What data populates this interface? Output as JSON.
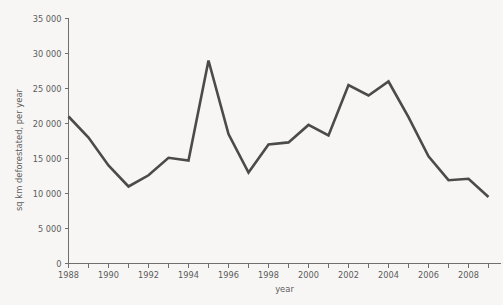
{
  "chart_data": {
    "type": "line",
    "title": "",
    "xlabel": "year",
    "ylabel": "sq km deforestated, per year",
    "x": [
      1988,
      1989,
      1990,
      1991,
      1992,
      1993,
      1994,
      1995,
      1996,
      1997,
      1998,
      1999,
      2000,
      2001,
      2002,
      2003,
      2004,
      2005,
      2006,
      2007,
      2008,
      2009
    ],
    "values": [
      21000,
      18000,
      14000,
      11000,
      12600,
      15100,
      14700,
      29000,
      18500,
      13000,
      17000,
      17300,
      19800,
      18300,
      25500,
      24000,
      26000,
      20900,
      15300,
      11900,
      12100,
      9500
    ],
    "series": [
      {
        "name": "sq km deforestated, per year",
        "values": [
          21000,
          18000,
          14000,
          11000,
          12600,
          15100,
          14700,
          29000,
          18500,
          13000,
          17000,
          17300,
          19800,
          18300,
          25500,
          24000,
          26000,
          20900,
          15300,
          11900,
          12100,
          9500
        ]
      }
    ],
    "xlim": [
      1988,
      2009.6
    ],
    "ylim": [
      0,
      35000
    ],
    "y_ticks": [
      0,
      5000,
      10000,
      15000,
      20000,
      25000,
      30000,
      35000
    ],
    "y_tick_labels": [
      "0",
      "5 000",
      "10 000",
      "15 000",
      "20 000",
      "25 000",
      "30 000",
      "35 000"
    ],
    "x_ticks": [
      1988,
      1989,
      1990,
      1991,
      1992,
      1993,
      1994,
      1995,
      1996,
      1997,
      1998,
      1999,
      2000,
      2001,
      2002,
      2003,
      2004,
      2005,
      2006,
      2007,
      2008,
      2009
    ],
    "x_tick_labels_shown": [
      "1988",
      "1990",
      "1992",
      "1994",
      "1996",
      "1998",
      "2000",
      "2002",
      "2004",
      "2006",
      "2008"
    ],
    "x_labeled_ticks": [
      1988,
      1990,
      1992,
      1994,
      1996,
      1998,
      2000,
      2002,
      2004,
      2006,
      2008
    ],
    "grid": false,
    "legend": false,
    "legend_position": "none",
    "line_color": "#4b4b4b",
    "axis_color": "#6f6f6f",
    "background_color": "#f7f6f4",
    "text_color": "#5c5c5c"
  }
}
